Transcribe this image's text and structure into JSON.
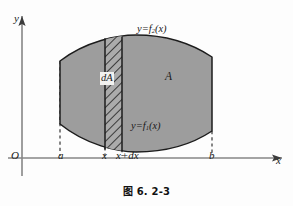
{
  "figure": {
    "caption": "图 6. 2-3",
    "axes": {
      "y_label": "y",
      "x_label": "x",
      "origin_label": "O"
    },
    "tick_labels": {
      "a": "a",
      "x": "x",
      "x_plus_dx": "x+dx",
      "b": "b"
    },
    "curve_labels": {
      "upper_prefix": "y=f",
      "upper_subscript": "2",
      "upper_suffix": "(x)",
      "upper_full": "y=f₂(x)",
      "lower_prefix": "y=f",
      "lower_subscript": "1",
      "lower_suffix": "(x)",
      "lower_full": "y=f₁(x)"
    },
    "region_labels": {
      "area": "A",
      "element": "dA"
    },
    "colors": {
      "region_fill": "#9d9d9d",
      "region_stroke": "#1c1c1c",
      "axis": "#7a7a7a",
      "hatch": "#2b2b2b",
      "dashed": "#3a3a3a",
      "background": "#fdfdfd"
    },
    "geometry": {
      "x_axis_y": 158,
      "y_axis_x": 22,
      "a_x": 60,
      "x_x": 105,
      "xdx_x": 122,
      "b_x": 212
    }
  }
}
